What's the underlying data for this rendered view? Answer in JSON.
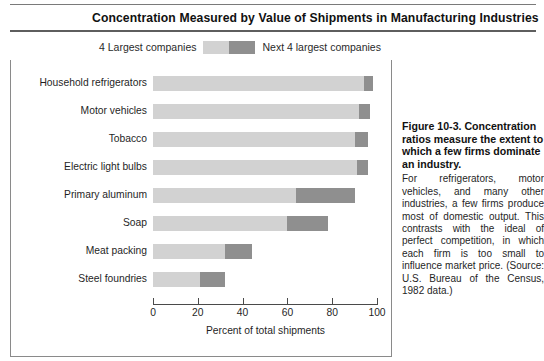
{
  "figure": {
    "title": "Concentration Measured by Value of Shipments in Manufacturing Industries",
    "caption_heading": "Figure 10-3.  Concentration ratios measure the extent to which a few firms dominate an industry.",
    "caption_body": "For refrigerators, motor vehicles, and many other industries, a few firms produce most of domestic output. This contrasts with the ideal of perfect competition, in which each firm is too small to influence market price. (Source: U.S. Bureau of the Census, 1982 data.)"
  },
  "legend": {
    "left_label": "4 Largest companies",
    "right_label": "Next 4 largest companies",
    "left_color": "#d2d2d2",
    "right_color": "#8f8f8f"
  },
  "chart_data": {
    "type": "bar",
    "orientation": "horizontal",
    "stacked": true,
    "title": "Concentration Measured by Value of Shipments in Manufacturing Industries",
    "xlabel": "Percent of total shipments",
    "ylabel": "",
    "xlim": [
      0,
      100
    ],
    "xticks": [
      0,
      20,
      40,
      60,
      80,
      100
    ],
    "xtick_labels": [
      "0",
      "20",
      "40",
      "60",
      "80",
      "100"
    ],
    "grid": false,
    "legend_position": "top",
    "categories": [
      "Household refrigerators",
      "Motor vehicles",
      "Tobacco",
      "Electric light bulbs",
      "Primary aluminum",
      "Soap",
      "Meat packing",
      "Steel foundries"
    ],
    "series": [
      {
        "name": "4 Largest companies",
        "color": "#d2d2d2",
        "values": [
          94,
          92,
          90,
          91,
          64,
          60,
          32,
          21
        ]
      },
      {
        "name": "Next 4 largest companies",
        "color": "#8f8f8f",
        "values": [
          4,
          5,
          6,
          5,
          26,
          18,
          12,
          11
        ]
      }
    ],
    "totals": [
      98,
      97,
      96,
      96,
      90,
      78,
      44,
      32
    ]
  }
}
